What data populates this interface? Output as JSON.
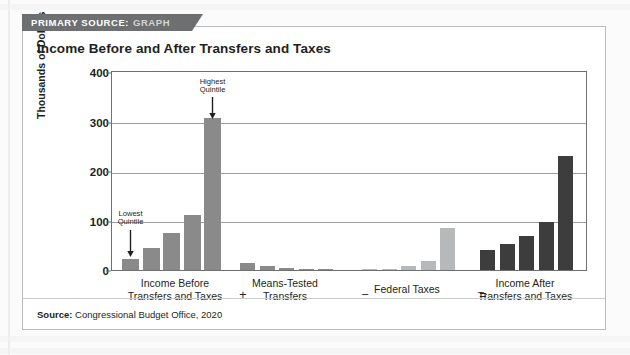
{
  "banner": {
    "label": "PRIMARY SOURCE:",
    "kind": "GRAPH"
  },
  "card": {
    "title": "Income Before and After Transfers and Taxes",
    "source_prefix": "Source:",
    "source_text": "Congressional Budget Office, 2020"
  },
  "colors": {
    "banner_bg": "#6d6f71",
    "banner_text": "#ffffff",
    "banner_kind": "#d2d4d5",
    "bar_medium": "#8a8a8a",
    "bar_light": "#b7b8b9",
    "bar_dark": "#3d3d3d",
    "axis": "#6d6f71",
    "grid": "#9a9c9e",
    "text": "#231f20",
    "card_border": "#b9bcbe"
  },
  "chart_data": {
    "type": "bar",
    "title": "Income Before and After Transfers and Taxes",
    "xlabel": "",
    "ylabel": "Thousands of Dollars",
    "ylim": [
      0,
      400
    ],
    "yticks": [
      0,
      100,
      200,
      300,
      400
    ],
    "grid": true,
    "legend": "none",
    "categories": [
      "Lowest Quintile",
      "Second Quintile",
      "Middle Quintile",
      "Fourth Quintile",
      "Highest Quintile"
    ],
    "groups": [
      {
        "name": "Income Before Transfers and Taxes",
        "operator_after": "+",
        "color": "#8a8a8a",
        "values": [
          22,
          45,
          75,
          112,
          308
        ]
      },
      {
        "name": "Means-Tested Transfers",
        "operator_after": "−",
        "color": "#8a8a8a",
        "values": [
          14,
          9,
          5,
          3,
          2
        ]
      },
      {
        "name": "Federal Taxes",
        "operator_after": "=",
        "color": "#b7b8b9",
        "values": [
          1,
          3,
          8,
          18,
          85
        ]
      },
      {
        "name": "Income After Transfers and Taxes",
        "operator_after": "",
        "color": "#3d3d3d",
        "values": [
          40,
          52,
          68,
          97,
          230
        ]
      }
    ],
    "annotations": [
      {
        "text_line1": "Lowest",
        "text_line2": "Quintile",
        "points_to": "group1-bar1"
      },
      {
        "text_line1": "Highest",
        "text_line2": "Quintile",
        "points_to": "group1-bar5"
      }
    ]
  },
  "axis_labels": {
    "group1_line1": "Income Before",
    "group1_line2": "Transfers and Taxes",
    "group2_line1": "Means-Tested",
    "group2_line2": "Transfers",
    "group3_line1": "Federal Taxes",
    "group3_line2": "",
    "group4_line1": "Income After",
    "group4_line2": "Transfers and Taxes",
    "op1": "+",
    "op2": "−",
    "op3": "="
  }
}
